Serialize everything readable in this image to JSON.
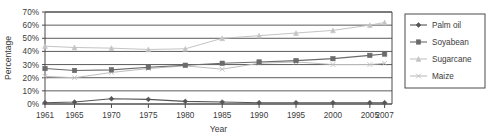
{
  "chart_data": {
    "type": "line",
    "title": "",
    "subtitle": "",
    "xlabel": "Year",
    "ylabel": "Percentage",
    "grid": true,
    "legend_position": "right",
    "xlim": [
      1961,
      2008
    ],
    "ylim": [
      0,
      70
    ],
    "ytick_labels": [
      "70%",
      "60%",
      "50%",
      "40%",
      "30%",
      "20%",
      "10%",
      "0%"
    ],
    "ytick_values": [
      70,
      60,
      50,
      40,
      30,
      20,
      10,
      0
    ],
    "xtick_labels": [
      "1961",
      "1965",
      "1970",
      "1975",
      "1980",
      "1985",
      "1990",
      "1995",
      "2000",
      "2005",
      "2007"
    ],
    "xtick_values": [
      1961,
      1965,
      1970,
      1975,
      1980,
      1985,
      1990,
      1995,
      2000,
      2005,
      2007
    ],
    "x": [
      1961,
      1965,
      1970,
      1975,
      1980,
      1985,
      1990,
      1995,
      2000,
      2005,
      2007
    ],
    "series": [
      {
        "name": "Palm oil",
        "marker": "diamond",
        "color": "#555555",
        "values": [
          1,
          1.5,
          4,
          3.5,
          2,
          1.5,
          1,
          1,
          1,
          1,
          1
        ]
      },
      {
        "name": "Soyabean",
        "marker": "square",
        "color": "#6b6b6b",
        "values": [
          27,
          25.5,
          26,
          28,
          29.5,
          31,
          32,
          33,
          34.5,
          37,
          38
        ]
      },
      {
        "name": "Sugarcane",
        "marker": "triangle",
        "color": "#c4c4c4",
        "values": [
          44,
          43,
          42.5,
          41.5,
          42,
          50,
          52,
          54,
          56,
          60,
          62
        ]
      },
      {
        "name": "Maize",
        "marker": "cross",
        "color": "#bdbdbd",
        "values": [
          21,
          20,
          24,
          27,
          29,
          26.5,
          31,
          32,
          30,
          30,
          31
        ]
      }
    ]
  }
}
